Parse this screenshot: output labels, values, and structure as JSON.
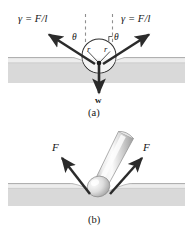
{
  "figure": {
    "title_caption_a": "(a)",
    "title_caption_b": "(b)",
    "colors": {
      "water_fill": "#d9d9d9",
      "water_top_band": "#ededed",
      "water_line": "#a8a8a8",
      "arrow": "#2b2b2b",
      "dashed": "#9a9a9a",
      "text": "#151515",
      "needle_light": "#f2f2f2",
      "needle_mid": "#c9c9c9",
      "needle_dark": "#9b9b9b",
      "background": "#ffffff"
    }
  },
  "panel_a": {
    "label_gamma_left": "γ = F/l",
    "label_gamma_right": "γ = F/l",
    "label_theta_left": "θ",
    "label_theta_right": "θ",
    "label_radius_left": "r",
    "label_radius_right": "r",
    "label_weight": "w",
    "caption": "(a)"
  },
  "panel_b": {
    "label_force_left": "F",
    "label_force_right": "F",
    "caption": "(b)"
  }
}
